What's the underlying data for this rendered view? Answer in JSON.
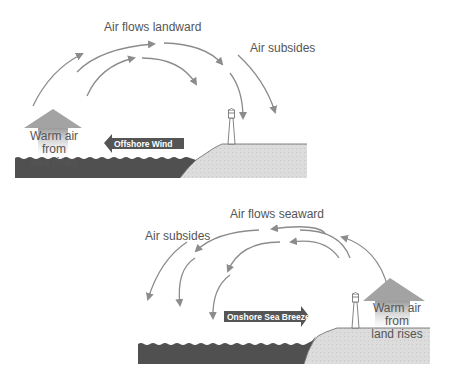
{
  "panels": {
    "top": {
      "title": "Land breeze (night)",
      "labels": {
        "flow": "Air flows landward",
        "subsides": "Air subsides",
        "rises_line1": "Warm air from",
        "rises_line2": "sea rises",
        "wind": "Offshore Wind"
      }
    },
    "bottom": {
      "title": "Sea breeze (day)",
      "labels": {
        "flow": "Air flows seaward",
        "subsides": "Air subsides",
        "rises_line1": "Warm air from",
        "rises_line2": "land rises",
        "wind": "Onshore Sea Breeze"
      }
    }
  },
  "colors": {
    "sea": "#505050",
    "land": "#d8d8d8",
    "arrow": "#8c8c8c",
    "wind_arrow": "#555555",
    "rising_arrow": "#a0a0a0",
    "text": "#555555"
  },
  "icons": [
    "lighthouse-icon",
    "wind-arrow-icon",
    "rising-air-arrow-icon",
    "curved-flow-arrow-icon"
  ]
}
